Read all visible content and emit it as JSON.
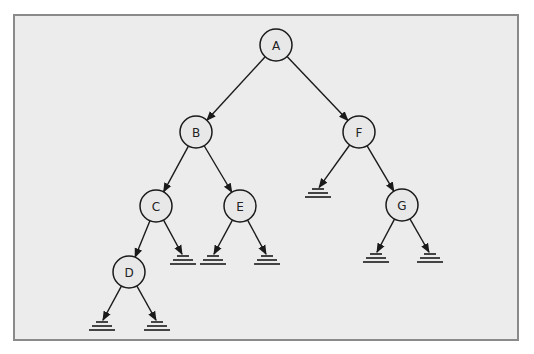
{
  "diagram": {
    "type": "binary-tree",
    "colors": {
      "background": "#ffffff",
      "frame_fill": "#ececec",
      "frame_stroke": "#8a8a8a",
      "ink": "#1a1a1a"
    },
    "nodes": [
      {
        "id": "A",
        "label": "A",
        "x": 276,
        "y": 45
      },
      {
        "id": "B",
        "label": "B",
        "x": 196,
        "y": 132
      },
      {
        "id": "F",
        "label": "F",
        "x": 359,
        "y": 132
      },
      {
        "id": "C",
        "label": "C",
        "x": 156,
        "y": 206
      },
      {
        "id": "E",
        "label": "E",
        "x": 240,
        "y": 206
      },
      {
        "id": "G",
        "label": "G",
        "x": 402,
        "y": 205
      },
      {
        "id": "D",
        "label": "D",
        "x": 129,
        "y": 272
      }
    ],
    "null_markers": [
      {
        "id": "C-right-null",
        "x": 183,
        "y": 256
      },
      {
        "id": "E-left-null",
        "x": 213,
        "y": 256
      },
      {
        "id": "E-right-null",
        "x": 267,
        "y": 256
      },
      {
        "id": "F-left-null",
        "x": 318,
        "y": 189
      },
      {
        "id": "G-left-null",
        "x": 376,
        "y": 254
      },
      {
        "id": "G-right-null",
        "x": 430,
        "y": 254
      },
      {
        "id": "D-left-null",
        "x": 102,
        "y": 322
      },
      {
        "id": "D-right-null",
        "x": 157,
        "y": 322
      }
    ],
    "edges": [
      {
        "from": "A",
        "to": "B"
      },
      {
        "from": "A",
        "to": "F"
      },
      {
        "from": "B",
        "to": "C"
      },
      {
        "from": "B",
        "to": "E"
      },
      {
        "from": "C",
        "to": "D"
      },
      {
        "from": "C",
        "to": "C-right-null"
      },
      {
        "from": "E",
        "to": "E-left-null"
      },
      {
        "from": "E",
        "to": "E-right-null"
      },
      {
        "from": "F",
        "to": "F-left-null"
      },
      {
        "from": "F",
        "to": "G"
      },
      {
        "from": "G",
        "to": "G-left-null"
      },
      {
        "from": "G",
        "to": "G-right-null"
      },
      {
        "from": "D",
        "to": "D-left-null"
      },
      {
        "from": "D",
        "to": "D-right-null"
      }
    ]
  }
}
